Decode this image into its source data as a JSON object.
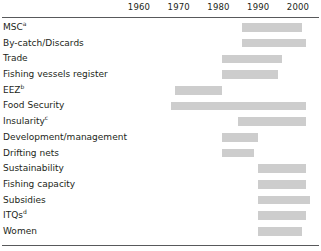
{
  "chart_data": {
    "type": "bar",
    "title": "",
    "subtitle": "",
    "xlabel": "",
    "ylabel": "",
    "orientation": "horizontal",
    "bar_style": "timeline-range",
    "grid": false,
    "legend": null,
    "xlim": [
      1955,
      2005
    ],
    "axis": {
      "ticks": [
        1960,
        1970,
        1980,
        1990,
        2000
      ],
      "tick_labels": [
        "1960",
        "1970",
        "1980",
        "1990",
        "2000"
      ],
      "position": "top"
    },
    "bar_color": "#cdcdcd",
    "rule_color": "#58595b",
    "categories": [
      "MSC",
      "By-catch/Discards",
      "Trade",
      "Fishing vessels register",
      "EEZ",
      "Food Security",
      "Insularity",
      "Development/management",
      "Drifting nets",
      "Sustainability",
      "Fishing capacity",
      "Subsidies",
      "ITQs",
      "Women"
    ],
    "rows": [
      {
        "label": "MSC",
        "superscript": "a",
        "start": 1986,
        "end": 2001
      },
      {
        "label": "By-catch/Discards",
        "superscript": "",
        "start": 1986,
        "end": 2002
      },
      {
        "label": "Trade",
        "superscript": "",
        "start": 1981,
        "end": 1996
      },
      {
        "label": "Fishing vessels register",
        "superscript": "",
        "start": 1981,
        "end": 1995
      },
      {
        "label": "EEZ",
        "superscript": "b",
        "start": 1969,
        "end": 1981
      },
      {
        "label": "Food Security",
        "superscript": "",
        "start": 1968,
        "end": 2002
      },
      {
        "label": "Insularity",
        "superscript": "c",
        "start": 1985,
        "end": 2002
      },
      {
        "label": "Development/management",
        "superscript": "",
        "start": 1981,
        "end": 1990
      },
      {
        "label": "Drifting nets",
        "superscript": "",
        "start": 1981,
        "end": 1989
      },
      {
        "label": "Sustainability",
        "superscript": "",
        "start": 1990,
        "end": 2002
      },
      {
        "label": "Fishing capacity",
        "superscript": "",
        "start": 1990,
        "end": 2002
      },
      {
        "label": "Subsidies",
        "superscript": "",
        "start": 1990,
        "end": 2003
      },
      {
        "label": "ITQs",
        "superscript": "d",
        "start": 1990,
        "end": 2002
      },
      {
        "label": "Women",
        "superscript": "",
        "start": 1990,
        "end": 2001
      }
    ]
  }
}
